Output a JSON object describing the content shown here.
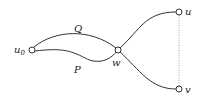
{
  "diagram": {
    "nodes": [
      {
        "id": "u0",
        "label": "u",
        "sub": "0",
        "x": 32,
        "y": 50
      },
      {
        "id": "w",
        "label": "w",
        "sub": "",
        "x": 118,
        "y": 50
      },
      {
        "id": "u",
        "label": "u",
        "sub": "",
        "x": 179,
        "y": 12
      },
      {
        "id": "v",
        "label": "v",
        "sub": "",
        "x": 179,
        "y": 89
      }
    ],
    "edges": [
      {
        "from": "u0",
        "to": "w",
        "label": "Q",
        "style": "solid"
      },
      {
        "from": "u0",
        "to": "w",
        "label": "P",
        "style": "solid"
      },
      {
        "from": "w",
        "to": "u",
        "label": "",
        "style": "solid"
      },
      {
        "from": "w",
        "to": "v",
        "label": "",
        "style": "solid"
      },
      {
        "from": "u",
        "to": "v",
        "label": "",
        "style": "dotted"
      }
    ],
    "colors": {
      "stroke": "#333333",
      "dotted": "#888888"
    }
  }
}
